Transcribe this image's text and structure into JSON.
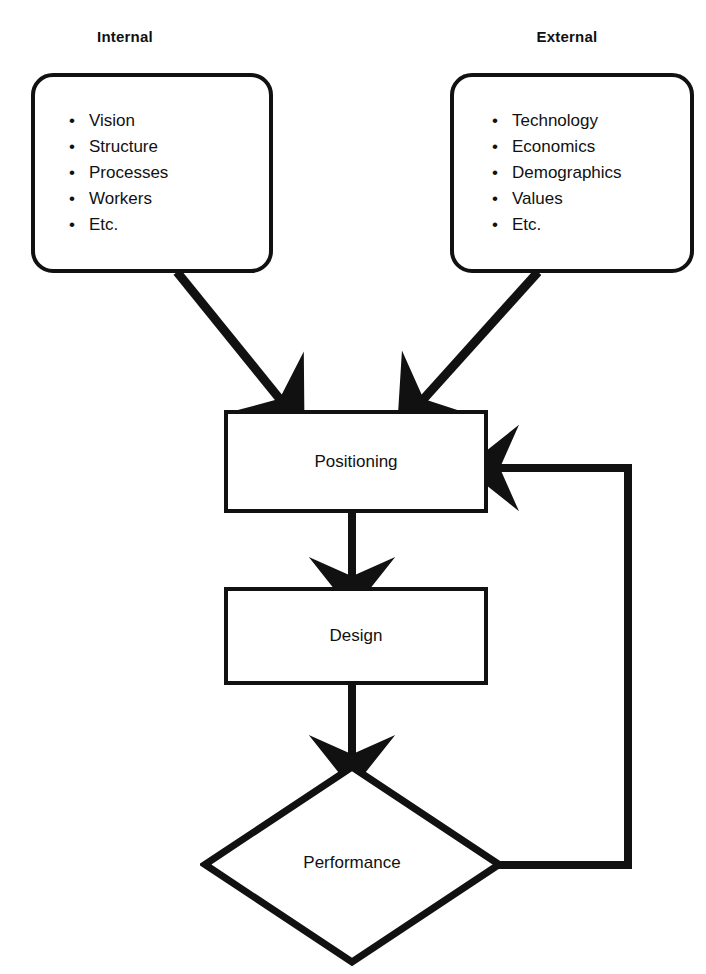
{
  "diagram": {
    "background_color": "#ffffff",
    "stroke_color": "#111111",
    "headings": {
      "internal": "Internal",
      "external": "External"
    },
    "source_boxes": [
      {
        "id": "internal",
        "heading": "Internal",
        "shape": "rounded-rectangle",
        "items": [
          "Vision",
          "Structure",
          "Processes",
          "Workers",
          "Etc."
        ]
      },
      {
        "id": "external",
        "heading": "External",
        "shape": "rounded-rectangle",
        "items": [
          "Technology",
          "Economics",
          "Demographics",
          "Values",
          "Etc."
        ]
      }
    ],
    "bullet_glyph": "•",
    "nodes": [
      {
        "id": "positioning",
        "label": "Positioning",
        "shape": "rectangle"
      },
      {
        "id": "design",
        "label": "Design",
        "shape": "rectangle"
      },
      {
        "id": "performance",
        "label": "Performance",
        "shape": "diamond"
      }
    ],
    "edges": [
      {
        "from": "internal",
        "to": "positioning",
        "style": "solid-arrow",
        "direction": "diagonal-down-right"
      },
      {
        "from": "external",
        "to": "positioning",
        "style": "solid-arrow",
        "direction": "diagonal-down-left"
      },
      {
        "from": "positioning",
        "to": "design",
        "style": "solid-arrow",
        "direction": "down"
      },
      {
        "from": "design",
        "to": "performance",
        "style": "solid-arrow",
        "direction": "down"
      },
      {
        "from": "performance",
        "to": "positioning",
        "style": "solid-arrow",
        "direction": "feedback-loop-right"
      }
    ]
  }
}
